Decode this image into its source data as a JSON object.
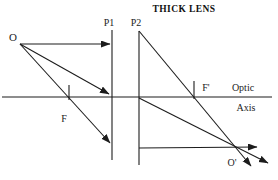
{
  "diagram": {
    "title": "THICK LENS",
    "labels": {
      "object_point": "O",
      "image_point": "O'",
      "principal_plane_1": "P1",
      "principal_plane_2": "P2",
      "front_focal_point": "F",
      "back_focal_point": "F'",
      "axis_word_1": "Optic",
      "axis_word_2": "Axis"
    },
    "colors": {
      "ink": "#1c1c1c",
      "background": "#ffffff"
    }
  }
}
